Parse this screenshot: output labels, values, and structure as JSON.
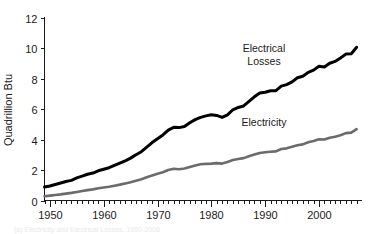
{
  "figure": {
    "background_color": "#ffffff",
    "caption": "(a) Electricity and Electrical Losses, 1950-2008"
  },
  "chart_data": {
    "type": "line",
    "title": "",
    "xlabel": "",
    "ylabel": "Quadrillion Btu",
    "xlim": [
      1949,
      2008
    ],
    "ylim": [
      0,
      12
    ],
    "grid": false,
    "legend_position": "inline-annotation",
    "y_ticks": [
      0,
      2,
      4,
      6,
      8,
      10,
      12
    ],
    "y_tick_labels": [
      "0",
      "2",
      "4",
      "6",
      "8",
      "10",
      "12"
    ],
    "x_ticks": [
      1950,
      1960,
      1970,
      1980,
      1990,
      2000
    ],
    "x_tick_labels": [
      "1950",
      "1960",
      "1970",
      "1980",
      "1990",
      "2000"
    ],
    "x_minor_tick_interval": 1,
    "x": [
      1949,
      1950,
      1951,
      1952,
      1953,
      1954,
      1955,
      1956,
      1957,
      1958,
      1959,
      1960,
      1961,
      1962,
      1963,
      1964,
      1965,
      1966,
      1967,
      1968,
      1969,
      1970,
      1971,
      1972,
      1973,
      1974,
      1975,
      1976,
      1977,
      1978,
      1979,
      1980,
      1981,
      1982,
      1983,
      1984,
      1985,
      1986,
      1987,
      1988,
      1989,
      1990,
      1991,
      1992,
      1993,
      1994,
      1995,
      1996,
      1997,
      1998,
      1999,
      2000,
      2001,
      2002,
      2003,
      2004,
      2005,
      2006,
      2007
    ],
    "series": [
      {
        "name": "Electrical Losses",
        "label": "Electrical\nLosses",
        "color": "#000000",
        "line_width": 3.0,
        "label_x": 264,
        "label_y": 52,
        "values": [
          0.88,
          0.95,
          1.05,
          1.15,
          1.25,
          1.32,
          1.48,
          1.6,
          1.72,
          1.8,
          1.95,
          2.05,
          2.15,
          2.3,
          2.45,
          2.6,
          2.78,
          3.0,
          3.2,
          3.5,
          3.8,
          4.05,
          4.3,
          4.62,
          4.8,
          4.78,
          4.85,
          5.1,
          5.3,
          5.45,
          5.55,
          5.62,
          5.58,
          5.45,
          5.62,
          5.95,
          6.1,
          6.2,
          6.5,
          6.8,
          7.05,
          7.1,
          7.2,
          7.2,
          7.5,
          7.6,
          7.78,
          8.05,
          8.15,
          8.4,
          8.55,
          8.8,
          8.75,
          9.0,
          9.12,
          9.35,
          9.6,
          9.62,
          10.05
        ]
      },
      {
        "name": "Electricity",
        "label": "Electricity",
        "color": "#6b6b6b",
        "line_width": 2.6,
        "label_x": 264,
        "label_y": 126,
        "values": [
          0.28,
          0.32,
          0.36,
          0.4,
          0.45,
          0.5,
          0.56,
          0.62,
          0.68,
          0.73,
          0.8,
          0.85,
          0.9,
          0.97,
          1.04,
          1.12,
          1.2,
          1.3,
          1.4,
          1.52,
          1.64,
          1.75,
          1.85,
          2.0,
          2.08,
          2.05,
          2.1,
          2.2,
          2.3,
          2.38,
          2.4,
          2.42,
          2.45,
          2.42,
          2.52,
          2.65,
          2.72,
          2.78,
          2.9,
          3.02,
          3.12,
          3.16,
          3.2,
          3.22,
          3.38,
          3.42,
          3.52,
          3.62,
          3.68,
          3.82,
          3.9,
          4.02,
          4.0,
          4.12,
          4.18,
          4.28,
          4.42,
          4.45,
          4.68
        ]
      }
    ]
  }
}
